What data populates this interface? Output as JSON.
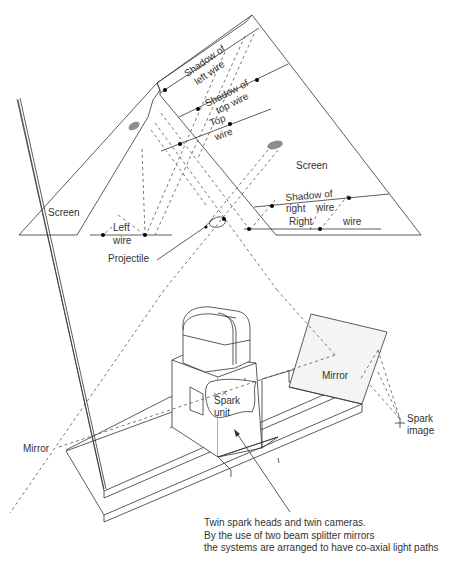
{
  "diagram": {
    "labels": {
      "screen_left": "Screen",
      "screen_right": "Screen",
      "shadow_left_wire_1": "Shadow of",
      "shadow_left_wire_2": "left wire",
      "shadow_top_wire_1": "Shadow of",
      "shadow_top_wire_2": "top wire",
      "top_wire_1": "Top",
      "top_wire_2": "wire",
      "left_wire_1": "Left",
      "left_wire_2": "wire",
      "projectile": "Projectile",
      "shadow_right_wire_1": "Shadow of",
      "shadow_right_wire_2": "right",
      "shadow_right_wire_3": "wire",
      "right_wire_1": "Right",
      "right_wire_2": "wire",
      "mirror_left": "Mirror",
      "mirror_right": "Mirror",
      "spark_unit_1": "Spark",
      "spark_unit_2": "unit",
      "spark_image_1": "Spark",
      "spark_image_2": "image"
    },
    "caption": [
      "Twin spark heads and twin cameras.",
      "By the use of two beam splitter mirrors",
      "the systems are arranged to have co-axial light paths"
    ],
    "colors": {
      "line": "#333333",
      "shadow_blob": "#8c8c8c",
      "mirror_fill": "#f4f4f4"
    }
  }
}
